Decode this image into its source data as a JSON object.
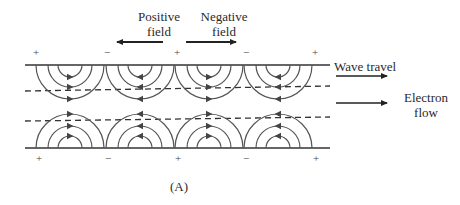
{
  "figure": {
    "caption": "(A)",
    "labels": {
      "positive_field": [
        "Positive",
        "field"
      ],
      "negative_field": [
        "Negative",
        "field"
      ],
      "wave_travel": "Wave travel",
      "electron_flow": [
        "Electron",
        "flow"
      ]
    },
    "top_signs": [
      "+",
      "−",
      "+",
      "−",
      "+"
    ],
    "bottom_signs": [
      "+",
      "−",
      "+",
      "−",
      "+"
    ],
    "arc_groups": [
      {
        "center_x": 70,
        "direction": "right"
      },
      {
        "center_x": 140,
        "direction": "left"
      },
      {
        "center_x": 209,
        "direction": "right"
      },
      {
        "center_x": 278,
        "direction": "left"
      }
    ],
    "colors": {
      "line": "#333333",
      "arc": "#555555"
    }
  }
}
